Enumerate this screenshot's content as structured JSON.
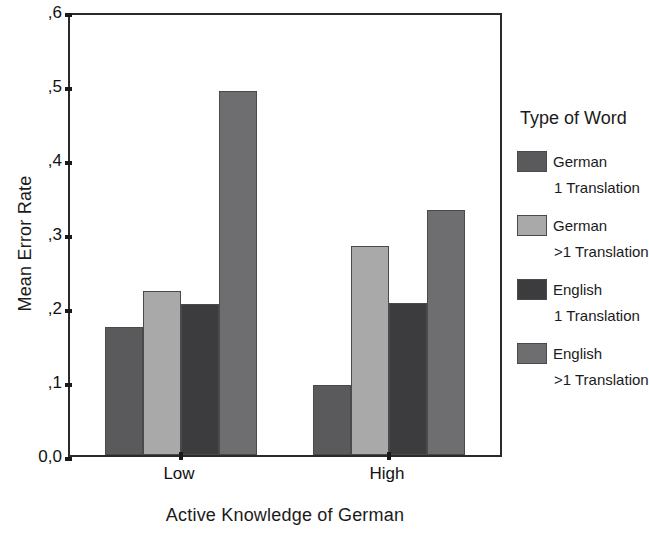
{
  "chart_data": {
    "type": "bar",
    "title": "",
    "xlabel": "Active Knowledge of German",
    "ylabel": "Mean Error Rate",
    "categories": [
      "Low",
      "High"
    ],
    "ylim": [
      0.0,
      0.6
    ],
    "ytick_labels": [
      "0,0",
      ",1",
      ",2",
      ",3",
      ",4",
      ",5",
      ",6"
    ],
    "ytick_values": [
      0.0,
      0.1,
      0.2,
      0.3,
      0.4,
      0.5,
      0.6
    ],
    "grid": false,
    "legend_position": "right",
    "legend_title": "Type of Word",
    "series": [
      {
        "name": "German 1 Translation",
        "label_line1": "German",
        "label_line2": "1 Translation",
        "color": "#5a5a5c",
        "values": [
          0.173,
          0.095
        ]
      },
      {
        "name": "German >1 Translation",
        "label_line1": "German",
        "label_line2": ">1 Translation",
        "color": "#a9a9a9",
        "values": [
          0.222,
          0.283
        ]
      },
      {
        "name": "English 1 Translation",
        "label_line1": "English",
        "label_line2": "1 Translation",
        "color": "#3c3c3e",
        "values": [
          0.204,
          0.206
        ]
      },
      {
        "name": "English >1 Translation",
        "label_line1": "English",
        "label_line2": ">1 Translation",
        "color": "#6e6e70",
        "values": [
          0.492,
          0.331
        ]
      }
    ]
  }
}
